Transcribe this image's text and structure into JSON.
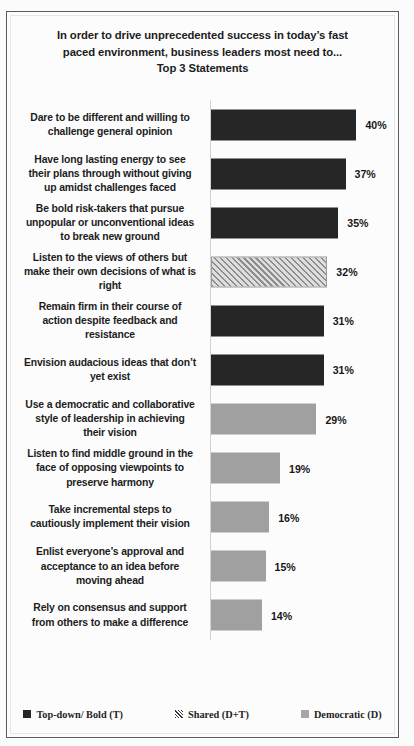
{
  "chart_data": {
    "type": "bar",
    "orientation": "horizontal",
    "title": "In order to drive unprecedented success in today’s fast\npaced environment, business leaders most need to...\nTop 3 Statements",
    "xlabel": "",
    "ylabel": "",
    "xlim": [
      0,
      44
    ],
    "grid": false,
    "legend_position": "bottom",
    "value_format": "percent",
    "categories": [
      "Dare to be different and willing to\nchallenge  general opinion",
      "Have long lasting energy to see\ntheir plans through without giving\nup amidst challenges faced",
      "Be bold risk-takers  that pursue\nunpopular or unconventional ideas\nto break new ground",
      "Listen to the views of others but\nmake their own decisions of what is\nright",
      "Remain firm in their course of\naction despite feedback and\nresistance",
      "Envision audacious ideas that don’t\nyet exist",
      "Use a democratic and collaborative\nstyle of leadership  in achieving\ntheir vision",
      "Listen to find middle ground in the\nface of opposing viewpoints  to\npreserve harmony",
      "Take incremental steps to\ncautiously implement their vision",
      "Enlist everyone’s approval and\nacceptance to an idea before\nmoving ahead",
      "Rely on consensus and support\nfrom others to make a difference"
    ],
    "values": [
      40,
      37,
      35,
      32,
      31,
      31,
      29,
      19,
      16,
      15,
      14
    ],
    "value_labels": [
      "40%",
      "37%",
      "35%",
      "32%",
      "31%",
      "31%",
      "29%",
      "19%",
      "16%",
      "15%",
      "14%"
    ],
    "series_of_bar": [
      "topdown",
      "topdown",
      "topdown",
      "shared",
      "topdown",
      "topdown",
      "democratic",
      "democratic",
      "democratic",
      "democratic",
      "democratic"
    ],
    "legend": [
      {
        "key": "topdown",
        "label": "Top-down/ Bold (T)",
        "color": "#262626",
        "pattern": "solid-dark"
      },
      {
        "key": "shared",
        "label": "Shared (D+T)",
        "color": "#8e8e8e",
        "pattern": "diagonal-hatch"
      },
      {
        "key": "democratic",
        "label": "Democratic (D)",
        "color": "#a0a0a0",
        "pattern": "solid-gray"
      }
    ]
  }
}
